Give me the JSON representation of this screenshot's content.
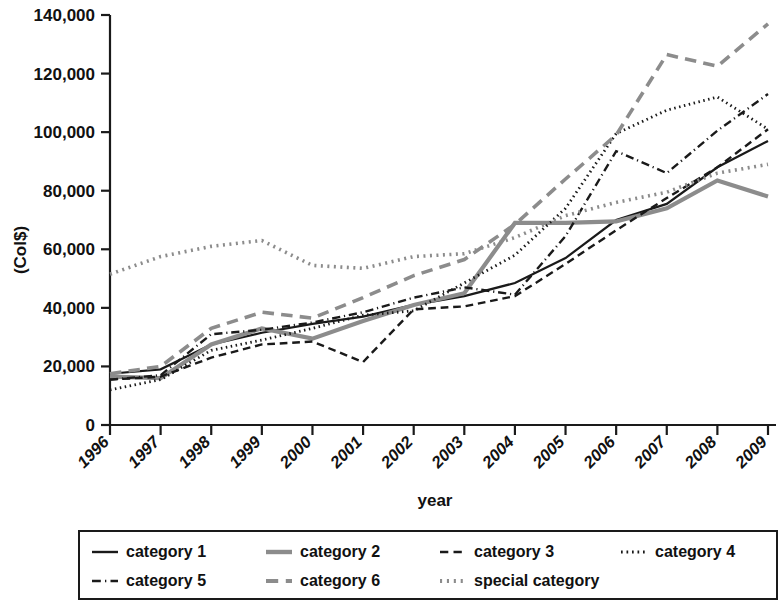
{
  "chart_data": {
    "type": "line",
    "title": "",
    "xlabel": "year",
    "ylabel": "(Col$)",
    "grid": false,
    "legend_position": "bottom",
    "xlim": [
      1996,
      2009
    ],
    "ylim": [
      0,
      140000
    ],
    "ytick_values": [
      0,
      20000,
      40000,
      60000,
      80000,
      100000,
      120000,
      140000
    ],
    "ytick_labels": [
      "0",
      "20,000",
      "40,000",
      "60,000",
      "80,000",
      "100,000",
      "120,000",
      "140,000"
    ],
    "x": [
      1996,
      1997,
      1998,
      1999,
      2000,
      2001,
      2002,
      2003,
      2004,
      2005,
      2006,
      2007,
      2008,
      2009
    ],
    "categories": [
      "1996",
      "1997",
      "1998",
      "1999",
      "2000",
      "2001",
      "2002",
      "2003",
      "2004",
      "2005",
      "2006",
      "2007",
      "2008",
      "2009"
    ],
    "series": [
      {
        "name": "category 1",
        "style": "solid",
        "color": "#1a1a1a",
        "width": 2.2,
        "values": [
          17500,
          19000,
          27500,
          31500,
          34500,
          37000,
          41000,
          44000,
          48500,
          57000,
          70000,
          75500,
          88000,
          97000
        ]
      },
      {
        "name": "category 2",
        "style": "solid",
        "color": "#8c8c8c",
        "width": 4.2,
        "values": [
          16500,
          16000,
          27500,
          33000,
          29500,
          35500,
          41000,
          45000,
          69000,
          69000,
          69500,
          74000,
          83500,
          78000
        ]
      },
      {
        "name": "category 3",
        "style": "dashed",
        "color": "#1a1a1a",
        "width": 2.4,
        "values": [
          15500,
          16500,
          23000,
          27500,
          28500,
          21500,
          39500,
          40500,
          44000,
          55000,
          66500,
          77500,
          88000,
          101000
        ]
      },
      {
        "name": "category 4",
        "style": "dotted",
        "color": "#1a1a1a",
        "width": 2.8,
        "values": [
          12000,
          15500,
          25500,
          29000,
          33000,
          37500,
          39000,
          48500,
          58000,
          74000,
          99500,
          107500,
          112000,
          101000
        ]
      },
      {
        "name": "category 5",
        "style": "dashdot",
        "color": "#1a1a1a",
        "width": 2.4,
        "values": [
          15500,
          17000,
          31000,
          32500,
          35000,
          38500,
          43500,
          47000,
          44500,
          64500,
          93500,
          86000,
          100500,
          113000
        ]
      },
      {
        "name": "category 6",
        "style": "dashed",
        "color": "#8c8c8c",
        "width": 3.6,
        "values": [
          17500,
          20000,
          33000,
          38500,
          36500,
          43500,
          51000,
          56500,
          68500,
          84000,
          99000,
          126500,
          122500,
          137000
        ]
      },
      {
        "name": "special category",
        "style": "dotted",
        "color": "#8c8c8c",
        "width": 3.6,
        "values": [
          51500,
          57500,
          61000,
          63000,
          54500,
          53500,
          57500,
          58500,
          64000,
          71500,
          76000,
          79500,
          86000,
          89000
        ]
      }
    ]
  },
  "legend": {
    "entries": [
      {
        "label": "category 1",
        "style": "solid",
        "color": "#1a1a1a",
        "width": 2.4
      },
      {
        "label": "category 2",
        "style": "solid",
        "color": "#8c8c8c",
        "width": 4.4
      },
      {
        "label": "category 3",
        "style": "dashed",
        "color": "#1a1a1a",
        "width": 2.6
      },
      {
        "label": "category 4",
        "style": "dotted",
        "color": "#1a1a1a",
        "width": 3.0
      },
      {
        "label": "category 5",
        "style": "dashdot",
        "color": "#1a1a1a",
        "width": 2.6
      },
      {
        "label": "category 6",
        "style": "dashed",
        "color": "#8c8c8c",
        "width": 3.8
      },
      {
        "label": "special category",
        "style": "dotted",
        "color": "#8c8c8c",
        "width": 3.8
      }
    ]
  }
}
